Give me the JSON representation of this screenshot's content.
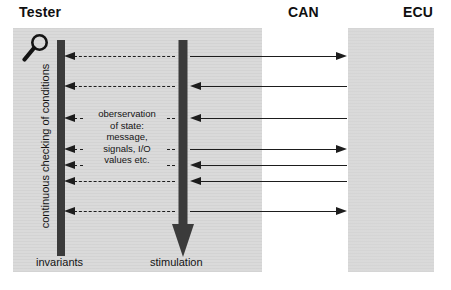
{
  "diagram": {
    "columns": [
      {
        "id": "tester",
        "label": "Tester"
      },
      {
        "id": "can",
        "label": "CAN"
      },
      {
        "id": "ecu",
        "label": "ECU"
      }
    ],
    "tester_panel": {
      "magnifier_icon": "magnifier-icon",
      "vertical_caption": "continuous checking of conditions",
      "invariants_label": "invariants",
      "stimulation_label": "stimulation",
      "observation_lines": [
        "oberservation",
        "of state:",
        "message,",
        "signals, I/O",
        "values etc."
      ]
    },
    "feedback_arrows": [
      {
        "index": 1,
        "y": 56,
        "style": "dashed",
        "direction": "left",
        "length": 113,
        "label": ""
      },
      {
        "index": 2,
        "y": 86,
        "style": "dashed",
        "direction": "left",
        "length": 113,
        "label": ""
      },
      {
        "index": 3,
        "y": 118,
        "style": "dashed",
        "direction": "left",
        "length": 113,
        "label": ""
      },
      {
        "index": 4,
        "y": 149,
        "style": "dashed",
        "direction": "left",
        "length": 113,
        "label": ""
      },
      {
        "index": 5,
        "y": 165,
        "style": "dashed",
        "direction": "left",
        "length": 113,
        "label": ""
      },
      {
        "index": 6,
        "y": 181,
        "style": "dashed",
        "direction": "left",
        "length": 113,
        "label": ""
      },
      {
        "index": 7,
        "y": 211,
        "style": "dashed",
        "direction": "left",
        "length": 113,
        "label": ""
      }
    ],
    "bus_arrows": [
      {
        "index": 1,
        "y": 56,
        "direction": "right",
        "from": "tester",
        "to": "ecu"
      },
      {
        "index": 2,
        "y": 86,
        "direction": "left",
        "from": "ecu",
        "to": "tester"
      },
      {
        "index": 3,
        "y": 118,
        "direction": "left",
        "from": "ecu",
        "to": "tester"
      },
      {
        "index": 4,
        "y": 149,
        "direction": "right",
        "from": "tester",
        "to": "ecu"
      },
      {
        "index": 5,
        "y": 165,
        "direction": "left",
        "from": "ecu",
        "to": "tester"
      },
      {
        "index": 6,
        "y": 181,
        "direction": "left",
        "from": "ecu",
        "to": "tester"
      },
      {
        "index": 7,
        "y": 211,
        "direction": "right",
        "from": "tester",
        "to": "ecu"
      }
    ],
    "colors": {
      "panel_gray": "#d9d9d9",
      "ink": "#1d1d1d",
      "bar_dark": "#3b3b3b",
      "background": "#ffffff"
    }
  }
}
